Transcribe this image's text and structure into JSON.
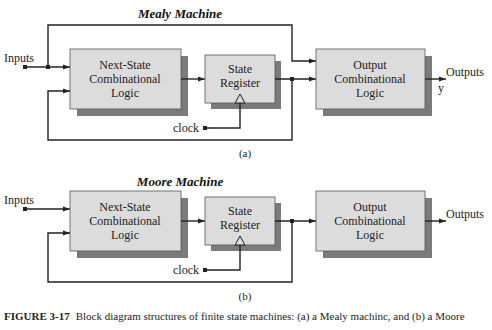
{
  "figure": {
    "number": "FIGURE 3-17",
    "caption": "Block diagram structures of finite state machines: (a) a Mealy machinc, and (b) a Moore"
  },
  "diagrams": [
    {
      "id": "a",
      "title": "Mealy Machine",
      "sublabel": "(a)",
      "input_label": "Inputs",
      "clock_label": "clock",
      "output_label": "Outputs",
      "output_var": "y",
      "blocks": {
        "next_state": [
          "Next-State",
          "Combinational",
          "Logic"
        ],
        "state_register": [
          "State",
          "Register"
        ],
        "output_logic": [
          "Output",
          "Combinational",
          "Logic"
        ]
      }
    },
    {
      "id": "b",
      "title": "Moore Machine",
      "sublabel": "(b)",
      "input_label": "Inputs",
      "clock_label": "clock",
      "output_label": "Outputs",
      "blocks": {
        "next_state": [
          "Next-State",
          "Combinational",
          "Logic"
        ],
        "state_register": [
          "State",
          "Register"
        ],
        "output_logic": [
          "Output",
          "Combinational",
          "Logic"
        ]
      }
    }
  ],
  "colors": {
    "block_fill": "#dcdcdc",
    "block_shadow": "#7a7a7a",
    "wire": "#222222"
  }
}
